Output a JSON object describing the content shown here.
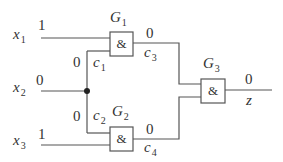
{
  "diagram": {
    "type": "logic-circuit",
    "line_color": "#555555",
    "inputs": [
      {
        "name": "x",
        "sub": "1",
        "value": "1"
      },
      {
        "name": "x",
        "sub": "2",
        "value": "0"
      },
      {
        "name": "x",
        "sub": "3",
        "value": "1"
      }
    ],
    "gates": [
      {
        "name": "G",
        "sub": "1",
        "symbol": "&"
      },
      {
        "name": "G",
        "sub": "2",
        "symbol": "&"
      },
      {
        "name": "G",
        "sub": "3",
        "symbol": "&"
      }
    ],
    "wires": [
      {
        "name": "c",
        "sub": "1",
        "value": "0"
      },
      {
        "name": "c",
        "sub": "2",
        "value": "0"
      },
      {
        "name": "c",
        "sub": "3",
        "value": "0"
      },
      {
        "name": "c",
        "sub": "4",
        "value": "0"
      }
    ],
    "output": {
      "name": "z",
      "value": "0"
    }
  }
}
